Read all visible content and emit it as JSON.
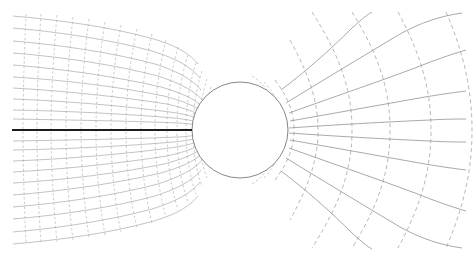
{
  "figure": {
    "width": 474,
    "height": 257,
    "background_color": "#ffffff"
  },
  "colors": {
    "grid_line": "#8c8c8c",
    "grid_line_fine": "#9a9a9a",
    "equipotential_line": "#9a9a9a",
    "cylinder_stroke": "#787878",
    "cylinder_fill": "#ffffff",
    "stagnation_line": "#1c1c1c"
  },
  "cylinder": {
    "label": "circular-cylinder",
    "center_x": 240,
    "center_y": 130,
    "radius": 48
  },
  "stagnation_streamline": {
    "label": "stagnation-streamline",
    "x_start": 12,
    "x_end": 192,
    "y": 130,
    "stroke_width": 1.9,
    "style": "solid"
  },
  "chart_data": {
    "type": "line",
    "subtitle": "Conformal map grid: dense upstream mesh, sparse downstream mesh",
    "xlabel": "",
    "ylabel": "",
    "xlim": [
      12,
      466
    ],
    "ylim": [
      12,
      245
    ],
    "grid": false,
    "legend": null,
    "annotations": [],
    "domain": {
      "x_min": 12,
      "x_max": 466,
      "y_min": 12,
      "y_max": 245,
      "centerline_y": 130
    },
    "series": [
      {
        "name": "streamlines-upstream",
        "style": "solid",
        "color": "#8c8c8c",
        "count": 19,
        "description": "Horizontal-family curves fanning from left edge, compressing around the cylinder",
        "psi_values": [
          -9,
          -8,
          -7,
          -6,
          -5,
          -4,
          -3,
          -2,
          -1,
          0,
          1,
          2,
          3,
          4,
          5,
          6,
          7,
          8,
          9
        ]
      },
      {
        "name": "equipotentials-upstream",
        "style": "solid",
        "color": "#9a9a9a",
        "count": 22,
        "description": "Vertical-family curves, densely spaced on left, wrapping the cylinder",
        "phi_values": [
          -22,
          -20,
          -18,
          -16,
          -14,
          -12,
          -10,
          -8,
          -6,
          -5,
          -4,
          -3.5,
          -3,
          -2.6,
          -2.3,
          -2.05,
          -1.85,
          -1.7,
          -1.58,
          -1.45,
          -1.32,
          -1.2
        ]
      },
      {
        "name": "streamlines-downstream",
        "style": "solid",
        "color": "#8c8c8c",
        "count": 9,
        "description": "Sparse horizontal-family curves downstream of the cylinder",
        "psi_values": [
          -4,
          -3,
          -2,
          -1,
          0,
          1,
          2,
          3,
          4
        ]
      },
      {
        "name": "equipotentials-downstream",
        "style": "dashed",
        "color": "#9a9a9a",
        "count": 6,
        "description": "Sparse dashed vertical-family curves downstream of the cylinder",
        "phi_values": [
          1.3,
          1.8,
          2.6,
          3.8,
          5.4,
          7.2
        ]
      },
      {
        "name": "cylinder-boundary",
        "style": "solid",
        "color": "#787878",
        "count": 1,
        "description": "Circle of radius 48 centred at (240,130)"
      },
      {
        "name": "stagnation-streamline",
        "style": "solid-bold",
        "color": "#1c1c1c",
        "count": 1,
        "description": "Bold dividing streamline along the upstream centerline up to the forward stagnation point",
        "psi_values": [
          0
        ]
      }
    ]
  }
}
